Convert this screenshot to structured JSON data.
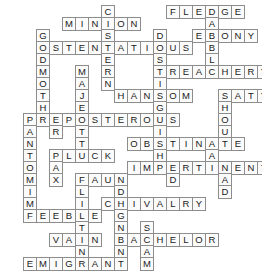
{
  "puzzle": {
    "title": "Crossword grid",
    "kind": "filled-crossword",
    "cell_size": 14,
    "origin": {
      "x": 23,
      "y": 5
    },
    "columns": 17,
    "rows": 19,
    "colors": {
      "cell_background": "#fbfbfb",
      "cell_border": "#8d8d8d",
      "letter": "#1a1a1a",
      "page_background": "#ffffff"
    },
    "across_entries": [
      {
        "answer": "MINION",
        "row": 1,
        "col": 3
      },
      {
        "answer": "FLEDGE",
        "row": 0,
        "col": 11
      },
      {
        "answer": "OSTENTATIOUS",
        "row": 3,
        "col": 1
      },
      {
        "answer": "EBONY",
        "row": 3,
        "col": 12
      },
      {
        "answer": "TREACHERY",
        "row": 5,
        "col": 8
      },
      {
        "answer": "HANSOM",
        "row": 7,
        "col": 6
      },
      {
        "answer": "SATYR",
        "row": 7,
        "col": 12
      },
      {
        "answer": "PREPOSTEROUS",
        "row": 9,
        "col": 0
      },
      {
        "answer": "OBSTINATE",
        "row": 11,
        "col": 7
      },
      {
        "answer": "PLUCK",
        "row": 12,
        "col": 2
      },
      {
        "answer": "IMPERTINENT",
        "row": 13,
        "col": 6
      },
      {
        "answer": "FAUN",
        "row": 14,
        "col": 3
      },
      {
        "answer": "CHIVALRY",
        "row": 16,
        "col": 4
      },
      {
        "answer": "FEEBLE",
        "row": 17,
        "col": 0
      },
      {
        "answer": "VAIN",
        "row": 19,
        "col": 2
      },
      {
        "answer": "BACHELOR",
        "row": 19,
        "col": 6
      },
      {
        "answer": "EMIGRANT",
        "row": 21,
        "col": 0
      }
    ],
    "down_entries": [
      {
        "answer": "CISTERN",
        "row": 0,
        "col": 6
      },
      {
        "answer": "GODMOTHER",
        "row": 2,
        "col": 1
      },
      {
        "answer": "DISH",
        "row": 2,
        "col": 10
      },
      {
        "answer": "MAJESTIC",
        "row": 5,
        "col": 4
      },
      {
        "answer": "FADABLE",
        "row": 0,
        "col": 14
      },
      {
        "answer": "STINGING",
        "row": 5,
        "col": 8
      },
      {
        "answer": "SHOULD",
        "row": 7,
        "col": 12
      },
      {
        "answer": "PANTOMIME",
        "row": 9,
        "col": 0
      },
      {
        "answer": "PRAX",
        "row": 9,
        "col": 2
      },
      {
        "answer": "ATTIT",
        "row": 9,
        "col": 4
      },
      {
        "answer": "NATAL",
        "row": 11,
        "col": 11
      },
      {
        "answer": "LITE",
        "row": 14,
        "col": 3
      },
      {
        "answer": "SHAM",
        "row": 18,
        "col": 9
      }
    ],
    "cells": [
      {
        "r": 0,
        "c": 6,
        "letter": "C"
      },
      {
        "r": 0,
        "c": 11,
        "letter": "F"
      },
      {
        "r": 0,
        "c": 12,
        "letter": "L"
      },
      {
        "r": 0,
        "c": 13,
        "letter": "E"
      },
      {
        "r": 0,
        "c": 14,
        "letter": "D"
      },
      {
        "r": 0,
        "c": 15,
        "letter": "G"
      },
      {
        "r": 0,
        "c": 16,
        "letter": "E"
      },
      {
        "r": 1,
        "c": 3,
        "letter": "M"
      },
      {
        "r": 1,
        "c": 4,
        "letter": "I"
      },
      {
        "r": 1,
        "c": 5,
        "letter": "N"
      },
      {
        "r": 1,
        "c": 6,
        "letter": "I"
      },
      {
        "r": 1,
        "c": 7,
        "letter": "O"
      },
      {
        "r": 1,
        "c": 8,
        "letter": "N"
      },
      {
        "r": 1,
        "c": 14,
        "letter": "A"
      },
      {
        "r": 2,
        "c": 1,
        "letter": "G"
      },
      {
        "r": 2,
        "c": 6,
        "letter": "S"
      },
      {
        "r": 2,
        "c": 10,
        "letter": "D"
      },
      {
        "r": 2,
        "c": 13,
        "letter": "E"
      },
      {
        "r": 2,
        "c": 14,
        "letter": "B"
      },
      {
        "r": 2,
        "c": 15,
        "letter": "O"
      },
      {
        "r": 2,
        "c": 16,
        "letter": "N"
      },
      {
        "r": 2,
        "c": 17,
        "letter": "Y"
      },
      {
        "r": 3,
        "c": 1,
        "letter": "O"
      },
      {
        "r": 3,
        "c": 2,
        "letter": "S"
      },
      {
        "r": 3,
        "c": 3,
        "letter": "T"
      },
      {
        "r": 3,
        "c": 4,
        "letter": "E"
      },
      {
        "r": 3,
        "c": 5,
        "letter": "N"
      },
      {
        "r": 3,
        "c": 6,
        "letter": "T"
      },
      {
        "r": 3,
        "c": 7,
        "letter": "A"
      },
      {
        "r": 3,
        "c": 8,
        "letter": "T"
      },
      {
        "r": 3,
        "c": 9,
        "letter": "I"
      },
      {
        "r": 3,
        "c": 10,
        "letter": "O"
      },
      {
        "r": 3,
        "c": 11,
        "letter": "U"
      },
      {
        "r": 3,
        "c": 12,
        "letter": "S"
      },
      {
        "r": 3,
        "c": 14,
        "letter": "B"
      },
      {
        "r": 4,
        "c": 1,
        "letter": "D"
      },
      {
        "r": 4,
        "c": 6,
        "letter": "E"
      },
      {
        "r": 4,
        "c": 10,
        "letter": "S"
      },
      {
        "r": 4,
        "c": 14,
        "letter": "L"
      },
      {
        "r": 5,
        "c": 1,
        "letter": "M"
      },
      {
        "r": 5,
        "c": 4,
        "letter": "M"
      },
      {
        "r": 5,
        "c": 6,
        "letter": "R"
      },
      {
        "r": 5,
        "c": 10,
        "letter": "T"
      },
      {
        "r": 5,
        "c": 11,
        "letter": "R"
      },
      {
        "r": 5,
        "c": 12,
        "letter": "E"
      },
      {
        "r": 5,
        "c": 13,
        "letter": "A"
      },
      {
        "r": 5,
        "c": 14,
        "letter": "C"
      },
      {
        "r": 5,
        "c": 15,
        "letter": "H"
      },
      {
        "r": 5,
        "c": 16,
        "letter": "E"
      },
      {
        "r": 5,
        "c": 17,
        "letter": "R"
      },
      {
        "r": 5,
        "c": 18,
        "letter": "Y"
      },
      {
        "r": 6,
        "c": 1,
        "letter": "O"
      },
      {
        "r": 6,
        "c": 4,
        "letter": "A"
      },
      {
        "r": 6,
        "c": 6,
        "letter": "N"
      },
      {
        "r": 6,
        "c": 10,
        "letter": "I"
      },
      {
        "r": 7,
        "c": 1,
        "letter": "T"
      },
      {
        "r": 7,
        "c": 4,
        "letter": "J"
      },
      {
        "r": 7,
        "c": 7,
        "letter": "H"
      },
      {
        "r": 7,
        "c": 8,
        "letter": "A"
      },
      {
        "r": 7,
        "c": 9,
        "letter": "N"
      },
      {
        "r": 7,
        "c": 10,
        "letter": "S"
      },
      {
        "r": 7,
        "c": 11,
        "letter": "O"
      },
      {
        "r": 7,
        "c": 12,
        "letter": "M"
      },
      {
        "r": 7,
        "c": 15,
        "letter": "S"
      },
      {
        "r": 7,
        "c": 16,
        "letter": "A"
      },
      {
        "r": 7,
        "c": 17,
        "letter": "T"
      },
      {
        "r": 7,
        "c": 18,
        "letter": "Y"
      },
      {
        "r": 7,
        "c": 19,
        "letter": "R"
      },
      {
        "r": 8,
        "c": 1,
        "letter": "H"
      },
      {
        "r": 8,
        "c": 4,
        "letter": "E"
      },
      {
        "r": 8,
        "c": 10,
        "letter": "G"
      },
      {
        "r": 8,
        "c": 15,
        "letter": "H"
      },
      {
        "r": 9,
        "c": 0,
        "letter": "P"
      },
      {
        "r": 9,
        "c": 1,
        "letter": "R"
      },
      {
        "r": 9,
        "c": 2,
        "letter": "E"
      },
      {
        "r": 9,
        "c": 3,
        "letter": "P"
      },
      {
        "r": 9,
        "c": 4,
        "letter": "O"
      },
      {
        "r": 9,
        "c": 5,
        "letter": "S"
      },
      {
        "r": 9,
        "c": 6,
        "letter": "T"
      },
      {
        "r": 9,
        "c": 7,
        "letter": "E"
      },
      {
        "r": 9,
        "c": 8,
        "letter": "R"
      },
      {
        "r": 9,
        "c": 9,
        "letter": "O"
      },
      {
        "r": 9,
        "c": 10,
        "letter": "U"
      },
      {
        "r": 9,
        "c": 11,
        "letter": "S"
      },
      {
        "r": 9,
        "c": 15,
        "letter": "O"
      },
      {
        "r": 10,
        "c": 0,
        "letter": "A"
      },
      {
        "r": 10,
        "c": 2,
        "letter": "R"
      },
      {
        "r": 10,
        "c": 4,
        "letter": "T"
      },
      {
        "r": 10,
        "c": 10,
        "letter": "I"
      },
      {
        "r": 10,
        "c": 15,
        "letter": "U"
      },
      {
        "r": 11,
        "c": 0,
        "letter": "N"
      },
      {
        "r": 11,
        "c": 4,
        "letter": "T"
      },
      {
        "r": 11,
        "c": 8,
        "letter": "O"
      },
      {
        "r": 11,
        "c": 9,
        "letter": "B"
      },
      {
        "r": 11,
        "c": 10,
        "letter": "S"
      },
      {
        "r": 11,
        "c": 11,
        "letter": "T"
      },
      {
        "r": 11,
        "c": 12,
        "letter": "I"
      },
      {
        "r": 11,
        "c": 13,
        "letter": "N"
      },
      {
        "r": 11,
        "c": 14,
        "letter": "A"
      },
      {
        "r": 11,
        "c": 15,
        "letter": "T"
      },
      {
        "r": 11,
        "c": 16,
        "letter": "E"
      },
      {
        "r": 12,
        "c": 0,
        "letter": "T"
      },
      {
        "r": 12,
        "c": 2,
        "letter": "P"
      },
      {
        "r": 12,
        "c": 3,
        "letter": "L"
      },
      {
        "r": 12,
        "c": 4,
        "letter": "U"
      },
      {
        "r": 12,
        "c": 5,
        "letter": "C"
      },
      {
        "r": 12,
        "c": 6,
        "letter": "K"
      },
      {
        "r": 12,
        "c": 10,
        "letter": "H"
      },
      {
        "r": 12,
        "c": 14,
        "letter": "A"
      },
      {
        "r": 13,
        "c": 0,
        "letter": "O"
      },
      {
        "r": 13,
        "c": 2,
        "letter": "A"
      },
      {
        "r": 13,
        "c": 8,
        "letter": "I"
      },
      {
        "r": 13,
        "c": 9,
        "letter": "M"
      },
      {
        "r": 13,
        "c": 10,
        "letter": "P"
      },
      {
        "r": 13,
        "c": 11,
        "letter": "E"
      },
      {
        "r": 13,
        "c": 12,
        "letter": "R"
      },
      {
        "r": 13,
        "c": 13,
        "letter": "T"
      },
      {
        "r": 13,
        "c": 14,
        "letter": "I"
      },
      {
        "r": 13,
        "c": 15,
        "letter": "N"
      },
      {
        "r": 13,
        "c": 16,
        "letter": "E"
      },
      {
        "r": 13,
        "c": 17,
        "letter": "N"
      },
      {
        "r": 13,
        "c": 18,
        "letter": "T"
      },
      {
        "r": 14,
        "c": 0,
        "letter": "M"
      },
      {
        "r": 14,
        "c": 2,
        "letter": "X"
      },
      {
        "r": 14,
        "c": 4,
        "letter": "F"
      },
      {
        "r": 14,
        "c": 5,
        "letter": "A"
      },
      {
        "r": 14,
        "c": 6,
        "letter": "U"
      },
      {
        "r": 14,
        "c": 7,
        "letter": "N"
      },
      {
        "r": 14,
        "c": 11,
        "letter": "D"
      },
      {
        "r": 14,
        "c": 15,
        "letter": "A"
      },
      {
        "r": 15,
        "c": 0,
        "letter": "I"
      },
      {
        "r": 15,
        "c": 4,
        "letter": "L"
      },
      {
        "r": 15,
        "c": 7,
        "letter": "D"
      },
      {
        "r": 15,
        "c": 15,
        "letter": "D"
      },
      {
        "r": 16,
        "c": 0,
        "letter": "M"
      },
      {
        "r": 16,
        "c": 4,
        "letter": "I"
      },
      {
        "r": 16,
        "c": 6,
        "letter": "C"
      },
      {
        "r": 16,
        "c": 7,
        "letter": "H"
      },
      {
        "r": 16,
        "c": 8,
        "letter": "I"
      },
      {
        "r": 16,
        "c": 9,
        "letter": "V"
      },
      {
        "r": 16,
        "c": 10,
        "letter": "A"
      },
      {
        "r": 16,
        "c": 11,
        "letter": "L"
      },
      {
        "r": 16,
        "c": 12,
        "letter": "R"
      },
      {
        "r": 16,
        "c": 13,
        "letter": "Y"
      },
      {
        "r": 17,
        "c": 0,
        "letter": "F"
      },
      {
        "r": 17,
        "c": 1,
        "letter": "E"
      },
      {
        "r": 17,
        "c": 2,
        "letter": "E"
      },
      {
        "r": 17,
        "c": 3,
        "letter": "B"
      },
      {
        "r": 17,
        "c": 4,
        "letter": "L"
      },
      {
        "r": 17,
        "c": 5,
        "letter": "E"
      },
      {
        "r": 17,
        "c": 7,
        "letter": "G"
      },
      {
        "r": 18,
        "c": 4,
        "letter": "T"
      },
      {
        "r": 18,
        "c": 7,
        "letter": "N"
      },
      {
        "r": 18,
        "c": 9,
        "letter": "S"
      },
      {
        "r": 19,
        "c": 2,
        "letter": "V"
      },
      {
        "r": 19,
        "c": 3,
        "letter": "A"
      },
      {
        "r": 19,
        "c": 4,
        "letter": "I"
      },
      {
        "r": 19,
        "c": 5,
        "letter": "N"
      },
      {
        "r": 19,
        "c": 7,
        "letter": "B"
      },
      {
        "r": 19,
        "c": 8,
        "letter": "A"
      },
      {
        "r": 19,
        "c": 9,
        "letter": "C"
      },
      {
        "r": 19,
        "c": 10,
        "letter": "H"
      },
      {
        "r": 19,
        "c": 11,
        "letter": "E"
      },
      {
        "r": 19,
        "c": 12,
        "letter": "L"
      },
      {
        "r": 19,
        "c": 13,
        "letter": "O"
      },
      {
        "r": 19,
        "c": 14,
        "letter": "R"
      },
      {
        "r": 20,
        "c": 4,
        "letter": "N"
      },
      {
        "r": 20,
        "c": 7,
        "letter": "N"
      },
      {
        "r": 20,
        "c": 9,
        "letter": "A"
      },
      {
        "r": 21,
        "c": 0,
        "letter": "E"
      },
      {
        "r": 21,
        "c": 1,
        "letter": "M"
      },
      {
        "r": 21,
        "c": 2,
        "letter": "I"
      },
      {
        "r": 21,
        "c": 3,
        "letter": "G"
      },
      {
        "r": 21,
        "c": 4,
        "letter": "R"
      },
      {
        "r": 21,
        "c": 5,
        "letter": "A"
      },
      {
        "r": 21,
        "c": 6,
        "letter": "N"
      },
      {
        "r": 21,
        "c": 7,
        "letter": "T"
      },
      {
        "r": 21,
        "c": 9,
        "letter": "M"
      }
    ]
  }
}
